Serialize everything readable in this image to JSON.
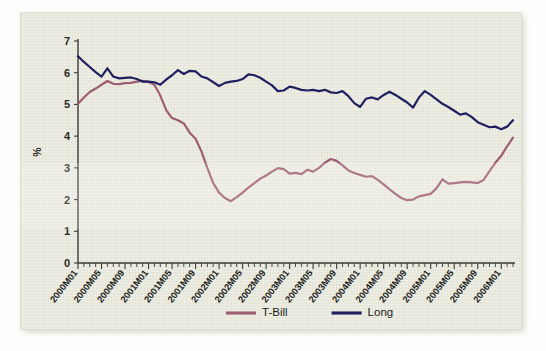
{
  "chart_data": {
    "type": "line",
    "title": "",
    "xlabel": "",
    "ylabel": "%",
    "ylim": [
      0,
      7
    ],
    "yticks": [
      0,
      1,
      2,
      3,
      4,
      5,
      6,
      7
    ],
    "grid": false,
    "legend_position": "bottom-center",
    "x_tick_labels": [
      "2000M01",
      "2000M05",
      "2000M09",
      "2001M01",
      "2001M05",
      "2001M09",
      "2002M01",
      "2002M05",
      "2002M09",
      "2003M01",
      "2003M05",
      "2003M09",
      "2004M01",
      "2004M05",
      "2004M09",
      "2005M01",
      "2005M05",
      "2005M09",
      "2006M01"
    ],
    "x_tick_label_interval_months": 4,
    "x_start": "2000M01",
    "x_end": "2006M03",
    "n_points": 75,
    "series": [
      {
        "name": "T-Bill",
        "color": "#9d5d72",
        "values": [
          5.02,
          5.22,
          5.39,
          5.5,
          5.62,
          5.74,
          5.65,
          5.64,
          5.67,
          5.68,
          5.72,
          5.74,
          5.71,
          5.62,
          5.28,
          4.82,
          4.57,
          4.5,
          4.4,
          4.11,
          3.92,
          3.52,
          3.0,
          2.52,
          2.22,
          2.05,
          1.95,
          2.08,
          2.22,
          2.38,
          2.52,
          2.66,
          2.76,
          2.88,
          2.99,
          2.96,
          2.82,
          2.84,
          2.8,
          2.94,
          2.88,
          3.0,
          3.16,
          3.28,
          3.22,
          3.08,
          2.92,
          2.84,
          2.78,
          2.72,
          2.74,
          2.62,
          2.48,
          2.32,
          2.18,
          2.05,
          1.98,
          2.0,
          2.1,
          2.14,
          2.18,
          2.36,
          2.64,
          2.5,
          2.52,
          2.54,
          2.56,
          2.54,
          2.52,
          2.62,
          2.9,
          3.16,
          3.38,
          3.68,
          3.95
        ]
      },
      {
        "name": "Long",
        "color": "#1f2060",
        "values": [
          6.52,
          6.34,
          6.18,
          6.02,
          5.88,
          6.14,
          5.88,
          5.82,
          5.84,
          5.85,
          5.8,
          5.72,
          5.72,
          5.7,
          5.62,
          5.78,
          5.92,
          6.08,
          5.96,
          6.06,
          6.04,
          5.88,
          5.82,
          5.7,
          5.58,
          5.68,
          5.72,
          5.74,
          5.8,
          5.95,
          5.92,
          5.84,
          5.72,
          5.6,
          5.42,
          5.44,
          5.56,
          5.52,
          5.46,
          5.44,
          5.46,
          5.42,
          5.46,
          5.38,
          5.36,
          5.42,
          5.26,
          5.04,
          4.92,
          5.18,
          5.22,
          5.16,
          5.3,
          5.4,
          5.3,
          5.18,
          5.06,
          4.9,
          5.22,
          5.42,
          5.3,
          5.16,
          5.02,
          4.92,
          4.8,
          4.68,
          4.72,
          4.6,
          4.44,
          4.36,
          4.28,
          4.3,
          4.22,
          4.3,
          4.5
        ]
      }
    ]
  },
  "legend": {
    "items": [
      {
        "label": "T-Bill",
        "color": "#9d5d72"
      },
      {
        "label": "Long",
        "color": "#1f2060"
      }
    ]
  }
}
